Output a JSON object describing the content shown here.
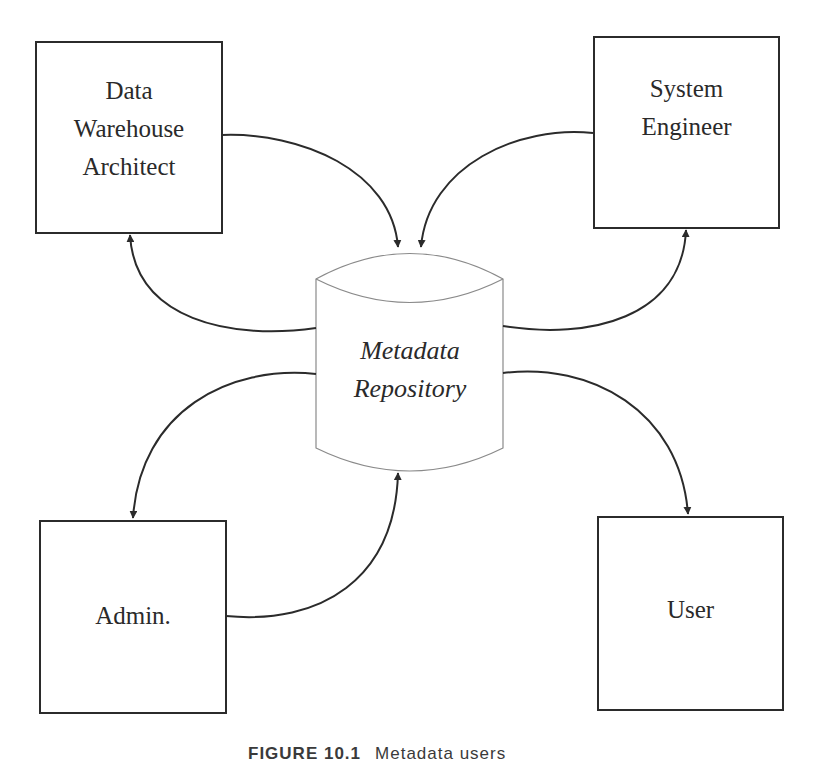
{
  "diagram": {
    "central_node": {
      "label": "Metadata\nRepository",
      "shape": "cylinder-icon"
    },
    "nodes": [
      {
        "id": "data-warehouse-architect",
        "label": "Data\nWarehouse\nArchitect"
      },
      {
        "id": "system-engineer",
        "label": "System\nEngineer"
      },
      {
        "id": "admin",
        "label": "Admin."
      },
      {
        "id": "user",
        "label": "User"
      }
    ],
    "edges": [
      {
        "from": "Data Warehouse Architect",
        "to": "Metadata Repository"
      },
      {
        "from": "Metadata Repository",
        "to": "Data Warehouse Architect"
      },
      {
        "from": "System Engineer",
        "to": "Metadata Repository"
      },
      {
        "from": "Metadata Repository",
        "to": "System Engineer"
      },
      {
        "from": "Metadata Repository",
        "to": "Admin."
      },
      {
        "from": "Admin.",
        "to": "Metadata Repository"
      },
      {
        "from": "Metadata Repository",
        "to": "User"
      }
    ],
    "colors": {
      "stroke": "#2b2b2b",
      "cylinder_stroke": "#8a8a8a",
      "background": "#ffffff"
    }
  },
  "caption": {
    "number": "FIGURE 10.1",
    "title": "Metadata users"
  }
}
